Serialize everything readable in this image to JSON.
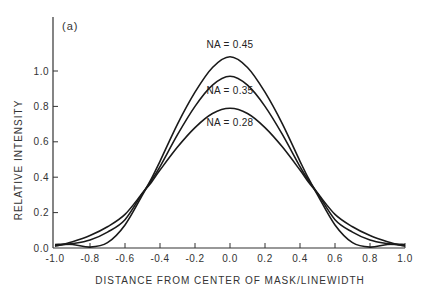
{
  "chart_data": {
    "type": "line",
    "panel_label": "(a)",
    "title": "",
    "xlabel": "DISTANCE FROM CENTER OF MASK/LINEWIDTH",
    "ylabel": "RELATIVE INTENSITY",
    "xlim": [
      -1.0,
      1.0
    ],
    "ylim": [
      0.0,
      1.25
    ],
    "xticks": [
      -1.0,
      -0.8,
      -0.6,
      -0.4,
      -0.2,
      0.0,
      0.2,
      0.4,
      0.6,
      0.8,
      1.0
    ],
    "xtick_labels": [
      "-1.0",
      "-0.8",
      "-0.6",
      "-0.4",
      "-0.2",
      "0.0",
      "0.2",
      "0.4",
      "0.6",
      "0.8",
      "1.0"
    ],
    "yticks": [
      0.0,
      0.2,
      0.4,
      0.6,
      0.8,
      1.0
    ],
    "ytick_labels": [
      "0.0",
      "0.2",
      "0.4",
      "0.6",
      "0.8",
      "1.0"
    ],
    "grid": false,
    "legend": "inline labels above curve peaks",
    "x": [
      -1.0,
      -0.9,
      -0.8,
      -0.7,
      -0.6,
      -0.5,
      -0.45,
      -0.4,
      -0.3,
      -0.2,
      -0.1,
      0.0,
      0.1,
      0.2,
      0.3,
      0.4,
      0.45,
      0.5,
      0.6,
      0.7,
      0.8,
      0.9,
      1.0
    ],
    "series": [
      {
        "name": "NA = 0.45",
        "label": "NA = 0.45",
        "peak": 1.08,
        "values": [
          0.02,
          0.02,
          0.005,
          0.03,
          0.13,
          0.3,
          0.39,
          0.49,
          0.7,
          0.88,
          1.02,
          1.08,
          1.02,
          0.88,
          0.7,
          0.49,
          0.39,
          0.3,
          0.13,
          0.03,
          0.005,
          0.02,
          0.02
        ]
      },
      {
        "name": "NA = 0.35",
        "label": "NA = 0.35",
        "peak": 0.97,
        "values": [
          0.015,
          0.025,
          0.045,
          0.09,
          0.16,
          0.31,
          0.38,
          0.46,
          0.64,
          0.8,
          0.92,
          0.97,
          0.92,
          0.8,
          0.64,
          0.46,
          0.38,
          0.31,
          0.16,
          0.09,
          0.045,
          0.025,
          0.015
        ]
      },
      {
        "name": "NA = 0.28",
        "label": "NA = 0.28",
        "peak": 0.79,
        "values": [
          0.01,
          0.035,
          0.07,
          0.12,
          0.19,
          0.31,
          0.37,
          0.44,
          0.57,
          0.68,
          0.76,
          0.79,
          0.76,
          0.68,
          0.57,
          0.44,
          0.37,
          0.31,
          0.19,
          0.12,
          0.07,
          0.035,
          0.01
        ]
      }
    ],
    "annotations": [
      {
        "text": "NA = 0.45",
        "x": 0.0,
        "y": 1.13
      },
      {
        "text": "NA = 0.35",
        "x": 0.0,
        "y": 0.87
      },
      {
        "text": "NA = 0.28",
        "x": 0.0,
        "y": 0.69
      }
    ],
    "style": {
      "line_color": "#1a1a1a",
      "axis_color": "#333333",
      "background": "#ffffff"
    }
  }
}
